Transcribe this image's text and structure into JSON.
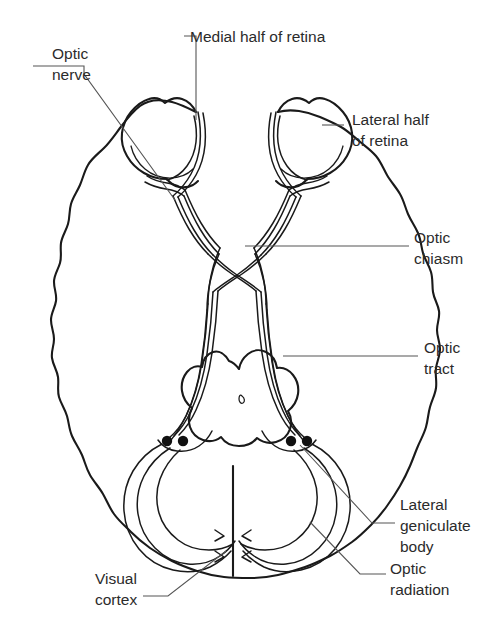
{
  "diagram": {
    "type": "anatomical-line-diagram",
    "background_color": "#ffffff",
    "ink_color": "#1a1a1a",
    "leader_color": "#555555",
    "text_color": "#2b2b2b"
  },
  "labels": {
    "medial_half_of_retina": {
      "line1": "Medial half of retina",
      "line2": ""
    },
    "optic_nerve": {
      "line1": "Optic",
      "line2": "nerve"
    },
    "lateral_half_of_retina": {
      "line1": "Lateral half",
      "line2": "of retina"
    },
    "optic_chiasm": {
      "line1": "Optic",
      "line2": "chiasm"
    },
    "optic_tract": {
      "line1": "Optic",
      "line2": "tract"
    },
    "lateral_geniculate_body": {
      "line1": "Lateral",
      "line2": "geniculate",
      "line3": "body"
    },
    "optic_radiation": {
      "line1": "Optic",
      "line2": "radiation"
    },
    "visual_cortex": {
      "line1": "Visual",
      "line2": "cortex"
    }
  },
  "structures": [
    {
      "name": "left-eyeball",
      "kind": "retina-globe"
    },
    {
      "name": "right-eyeball",
      "kind": "retina-globe"
    },
    {
      "name": "optic-nerve-left",
      "kind": "fiber-bundle"
    },
    {
      "name": "optic-nerve-right",
      "kind": "fiber-bundle"
    },
    {
      "name": "optic-chiasm",
      "kind": "decussation"
    },
    {
      "name": "optic-tract-left",
      "kind": "fiber-bundle"
    },
    {
      "name": "optic-tract-right",
      "kind": "fiber-bundle"
    },
    {
      "name": "lateral-geniculate-body-left",
      "kind": "nucleus-dot"
    },
    {
      "name": "lateral-geniculate-body-right",
      "kind": "nucleus-dot"
    },
    {
      "name": "optic-radiation-left",
      "kind": "fiber-bundle"
    },
    {
      "name": "optic-radiation-right",
      "kind": "fiber-bundle"
    },
    {
      "name": "visual-cortex",
      "kind": "occipital-pole"
    },
    {
      "name": "midbrain",
      "kind": "brainstem"
    },
    {
      "name": "cerebral-outline",
      "kind": "brain-silhouette"
    }
  ]
}
